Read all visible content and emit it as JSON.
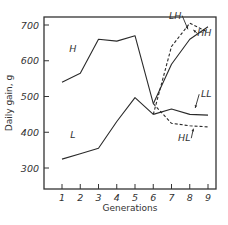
{
  "chart_data": {
    "type": "line",
    "title": "",
    "xlabel": "Generations",
    "ylabel": "Daily gain, g",
    "x": [
      1,
      2,
      3,
      4,
      5,
      6,
      7,
      8,
      9
    ],
    "x_ticks": [
      "1",
      "2",
      "3",
      "4",
      "5",
      "6",
      "7",
      "8",
      "9"
    ],
    "y_ticks": [
      "300",
      "400",
      "500",
      "600",
      "700"
    ],
    "ylim": [
      250,
      740
    ],
    "xlim": [
      0.6,
      9.5
    ],
    "grid": false,
    "legend": "inline labels",
    "series": [
      {
        "name": "H",
        "style": "solid",
        "x": [
          1,
          2,
          3,
          4,
          5,
          6
        ],
        "values": [
          540,
          565,
          660,
          655,
          670,
          480
        ]
      },
      {
        "name": "L",
        "style": "solid",
        "x": [
          1,
          2,
          3,
          4,
          5,
          6
        ],
        "values": [
          325,
          340,
          355,
          430,
          497,
          450
        ]
      },
      {
        "name": "HH",
        "style": "solid",
        "x": [
          6,
          7,
          8,
          9
        ],
        "values": [
          480,
          590,
          660,
          695
        ]
      },
      {
        "name": "LH",
        "style": "dashed",
        "x": [
          6,
          7,
          8,
          9
        ],
        "values": [
          450,
          640,
          705,
          680
        ]
      },
      {
        "name": "LL",
        "style": "solid",
        "x": [
          6,
          7,
          8,
          9
        ],
        "values": [
          450,
          465,
          450,
          448
        ]
      },
      {
        "name": "HL",
        "style": "dashed",
        "x": [
          6,
          7,
          8,
          9
        ],
        "values": [
          480,
          425,
          418,
          415
        ]
      }
    ],
    "annotations": [
      {
        "text": "H",
        "x": 1.6,
        "y": 625
      },
      {
        "text": "L",
        "x": 1.6,
        "y": 385
      },
      {
        "text": "LH",
        "x": 7.2,
        "y": 718,
        "arrow_to": [
          7.9,
          688
        ]
      },
      {
        "text": "HH",
        "x": 8.8,
        "y": 668,
        "arrow_to": [
          8.2,
          686
        ]
      },
      {
        "text": "LL",
        "x": 8.9,
        "y": 498,
        "arrow_to": [
          8.3,
          468
        ]
      },
      {
        "text": "HL",
        "x": 7.7,
        "y": 375,
        "arrow_to": [
          8.2,
          410
        ]
      }
    ]
  },
  "colors": {
    "line": "#2a2a2a",
    "axis": "#333333",
    "background": "#ffffff"
  }
}
